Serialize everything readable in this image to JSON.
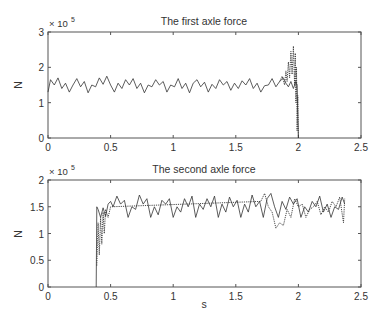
{
  "figure": {
    "background": "#ffffff",
    "axis_color": "#555555",
    "line_color": "#333333"
  },
  "chart_data": [
    {
      "type": "line",
      "title": "The first axle force",
      "xlabel": "",
      "ylabel": "N",
      "y_exponent_label": "× 10",
      "y_exponent": "5",
      "xlim": [
        0,
        2.5
      ],
      "ylim": [
        0,
        300000
      ],
      "xticks": [
        "0",
        "0.5",
        "1",
        "1.5",
        "2",
        "2.5"
      ],
      "yticks": [
        "0",
        "1",
        "2",
        "3"
      ],
      "grid": false,
      "legend": "none",
      "series": [
        {
          "name": "solid",
          "style": "solid",
          "x": [
            0.0,
            0.02,
            0.05,
            0.08,
            0.11,
            0.14,
            0.17,
            0.2,
            0.23,
            0.26,
            0.29,
            0.32,
            0.35,
            0.38,
            0.41,
            0.44,
            0.47,
            0.5,
            0.53,
            0.56,
            0.59,
            0.62,
            0.65,
            0.68,
            0.71,
            0.74,
            0.77,
            0.8,
            0.83,
            0.86,
            0.89,
            0.92,
            0.95,
            0.98,
            1.01,
            1.04,
            1.07,
            1.1,
            1.13,
            1.16,
            1.19,
            1.22,
            1.25,
            1.28,
            1.31,
            1.34,
            1.37,
            1.4,
            1.43,
            1.46,
            1.49,
            1.52,
            1.55,
            1.58,
            1.61,
            1.64,
            1.67,
            1.7,
            1.73,
            1.76,
            1.79,
            1.82,
            1.85,
            1.88,
            1.9,
            1.92,
            1.94,
            1.96,
            1.98,
            1.99,
            2.0
          ],
          "y": [
            130000,
            165000,
            150000,
            170000,
            140000,
            155000,
            130000,
            150000,
            168000,
            145000,
            160000,
            128000,
            150000,
            145000,
            170000,
            152000,
            175000,
            150000,
            130000,
            155000,
            140000,
            165000,
            150000,
            168000,
            140000,
            155000,
            128000,
            150000,
            145000,
            165000,
            150000,
            160000,
            130000,
            150000,
            145000,
            168000,
            140000,
            155000,
            128000,
            155000,
            165000,
            145000,
            158000,
            130000,
            152000,
            140000,
            165000,
            150000,
            160000,
            135000,
            155000,
            140000,
            162000,
            150000,
            168000,
            140000,
            155000,
            130000,
            148000,
            150000,
            168000,
            145000,
            160000,
            170000,
            155000,
            145000,
            160000,
            140000,
            160000,
            150000,
            0
          ]
        },
        {
          "name": "dotted",
          "style": "dotted",
          "x": [
            1.85,
            1.87,
            1.89,
            1.9,
            1.91,
            1.92,
            1.93,
            1.94,
            1.95,
            1.96,
            1.97,
            1.975,
            1.98,
            1.985,
            1.99,
            1.995,
            2.0
          ],
          "y": [
            160000,
            175000,
            150000,
            190000,
            160000,
            215000,
            170000,
            245000,
            180000,
            260000,
            150000,
            240000,
            100000,
            200000,
            20000,
            120000,
            0
          ]
        }
      ]
    },
    {
      "type": "line",
      "title": "The second axle force",
      "xlabel": "s",
      "ylabel": "N",
      "y_exponent_label": "× 10",
      "y_exponent": "5",
      "xlim": [
        0,
        2.5
      ],
      "ylim": [
        0,
        200000
      ],
      "xticks": [
        "0",
        "0.5",
        "1",
        "1.5",
        "2",
        "2.5"
      ],
      "yticks": [
        "0",
        "0.5",
        "1",
        "1.5",
        "2"
      ],
      "grid": false,
      "legend": "none",
      "series": [
        {
          "name": "solid",
          "style": "solid",
          "x": [
            0.385,
            0.39,
            0.4,
            0.42,
            0.44,
            0.46,
            0.48,
            0.5,
            0.52,
            0.55,
            0.58,
            0.61,
            0.64,
            0.67,
            0.7,
            0.73,
            0.76,
            0.79,
            0.82,
            0.85,
            0.88,
            0.91,
            0.94,
            0.97,
            1.0,
            1.03,
            1.06,
            1.09,
            1.12,
            1.15,
            1.18,
            1.21,
            1.24,
            1.27,
            1.3,
            1.33,
            1.36,
            1.39,
            1.42,
            1.45,
            1.48,
            1.51,
            1.54,
            1.57,
            1.6,
            1.63,
            1.66,
            1.69,
            1.72,
            1.75,
            1.78,
            1.81,
            1.84,
            1.87,
            1.9,
            1.93,
            1.96,
            1.99,
            2.02,
            2.05,
            2.08,
            2.11,
            2.14,
            2.17,
            2.2,
            2.23,
            2.26,
            2.29,
            2.32,
            2.35,
            2.37
          ],
          "y": [
            0,
            150000,
            145000,
            130000,
            148000,
            132000,
            155000,
            160000,
            150000,
            170000,
            155000,
            162000,
            130000,
            150000,
            145000,
            172000,
            155000,
            165000,
            130000,
            150000,
            135000,
            162000,
            155000,
            165000,
            130000,
            150000,
            140000,
            165000,
            150000,
            170000,
            130000,
            155000,
            145000,
            165000,
            150000,
            170000,
            130000,
            155000,
            140000,
            168000,
            150000,
            162000,
            130000,
            155000,
            140000,
            172000,
            150000,
            160000,
            130000,
            165000,
            175000,
            150000,
            130000,
            160000,
            145000,
            168000,
            155000,
            165000,
            130000,
            150000,
            140000,
            160000,
            150000,
            170000,
            140000,
            155000,
            130000,
            150000,
            145000,
            168000,
            155000
          ]
        },
        {
          "name": "dotted",
          "style": "dotted",
          "x": [
            0.39,
            0.4,
            0.41,
            0.42,
            0.43,
            0.44,
            0.45,
            0.46,
            0.48,
            0.5,
            1.7,
            1.73,
            1.76,
            1.79,
            1.82,
            1.85,
            1.88,
            1.91,
            1.94,
            1.97,
            2.0,
            2.03,
            2.06,
            2.09,
            2.12,
            2.15,
            2.18,
            2.21,
            2.24,
            2.27,
            2.3,
            2.33,
            2.36,
            2.37
          ],
          "y": [
            40000,
            120000,
            60000,
            130000,
            80000,
            140000,
            100000,
            145000,
            130000,
            150000,
            160000,
            175000,
            150000,
            140000,
            110000,
            120000,
            115000,
            145000,
            130000,
            165000,
            150000,
            155000,
            130000,
            145000,
            150000,
            160000,
            135000,
            150000,
            140000,
            160000,
            150000,
            168000,
            120000,
            165000
          ]
        }
      ]
    }
  ]
}
